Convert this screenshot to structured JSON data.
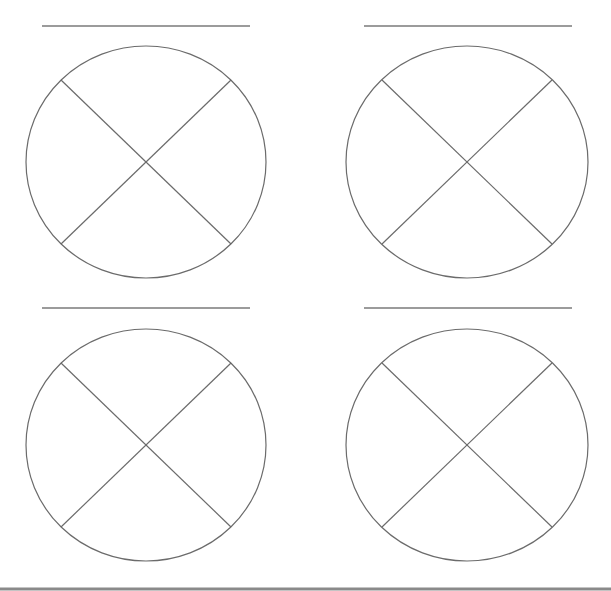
{
  "worksheet": {
    "type": "fraction-circles",
    "stroke_color": "#6b6b6b",
    "background_color": "#ffffff",
    "items": [
      {
        "id": "circle-1",
        "label_line": {
          "x1": 42,
          "x2": 250,
          "y": 26
        },
        "circle": {
          "cx": 146,
          "cy": 162,
          "rx": 120,
          "ry": 116
        },
        "parts": 4,
        "dividers": [
          {
            "x1": 61,
            "y1": 80,
            "x2": 231,
            "y2": 244
          },
          {
            "x1": 231,
            "y1": 80,
            "x2": 61,
            "y2": 244
          }
        ]
      },
      {
        "id": "circle-2",
        "label_line": {
          "x1": 364,
          "x2": 572,
          "y": 26
        },
        "circle": {
          "cx": 467,
          "cy": 162,
          "rx": 121,
          "ry": 116
        },
        "parts": 4,
        "dividers": [
          {
            "x1": 382,
            "y1": 80,
            "x2": 552,
            "y2": 244
          },
          {
            "x1": 552,
            "y1": 80,
            "x2": 382,
            "y2": 244
          }
        ]
      },
      {
        "id": "circle-3",
        "label_line": {
          "x1": 42,
          "x2": 250,
          "y": 308
        },
        "circle": {
          "cx": 146,
          "cy": 445,
          "rx": 120,
          "ry": 116
        },
        "parts": 4,
        "dividers": [
          {
            "x1": 61,
            "y1": 363,
            "x2": 231,
            "y2": 527
          },
          {
            "x1": 231,
            "y1": 363,
            "x2": 61,
            "y2": 527
          }
        ]
      },
      {
        "id": "circle-4",
        "label_line": {
          "x1": 364,
          "x2": 572,
          "y": 308
        },
        "circle": {
          "cx": 467,
          "cy": 445,
          "rx": 121,
          "ry": 116
        },
        "parts": 4,
        "dividers": [
          {
            "x1": 382,
            "y1": 363,
            "x2": 552,
            "y2": 527
          },
          {
            "x1": 552,
            "y1": 363,
            "x2": 382,
            "y2": 527
          }
        ]
      }
    ],
    "bottom_rule": {
      "x1": 0,
      "x2": 611,
      "y": 589
    }
  }
}
